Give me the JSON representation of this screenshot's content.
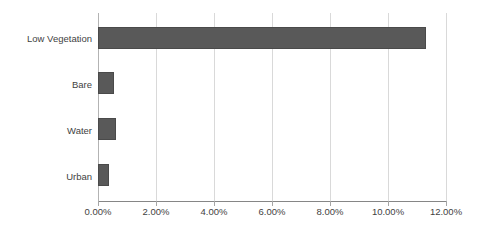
{
  "chart_data": {
    "type": "bar",
    "orientation": "horizontal",
    "title": "",
    "subtitle": "",
    "xlabel": "",
    "ylabel": "",
    "categories": [
      "Low Vegetation",
      "Bare",
      "Water",
      "Urban"
    ],
    "values": [
      11.3,
      0.56,
      0.63,
      0.37
    ],
    "value_format": "percent",
    "xlim": [
      0,
      12
    ],
    "xticks": [
      0,
      2,
      4,
      6,
      8,
      10,
      12
    ],
    "xticklabels": [
      "0.00%",
      "2.00%",
      "4.00%",
      "6.00%",
      "8.00%",
      "10.00%",
      "12.00%"
    ],
    "grid": true,
    "grid_axis": "x",
    "legend": false,
    "legend_position": "none",
    "series": [
      {
        "name": "",
        "values": [
          11.3,
          0.56,
          0.63,
          0.37
        ]
      }
    ],
    "colors": {
      "bar_fill": "#595959",
      "bar_border": "#4a4a4a",
      "gridline": "#d9d9d9",
      "axis_line": "#868686",
      "tick": "#a6a6a6",
      "text": "#3f3f3f",
      "background": "#ffffff"
    }
  }
}
